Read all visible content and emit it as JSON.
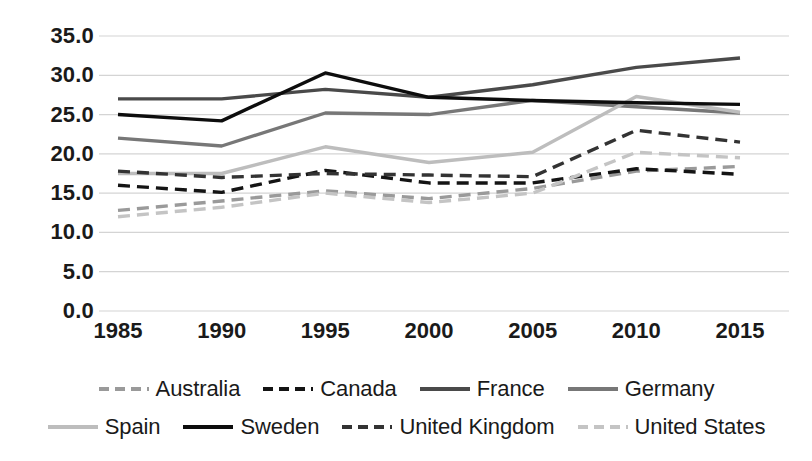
{
  "chart_data": {
    "type": "line",
    "title": "",
    "xlabel": "",
    "ylabel": "",
    "x": [
      1985,
      1990,
      1995,
      2000,
      2005,
      2010,
      2015
    ],
    "categories": [
      "1985",
      "1990",
      "1995",
      "2000",
      "2005",
      "2010",
      "2015"
    ],
    "ylim": [
      0.0,
      35.0
    ],
    "ytick_labels": [
      "35.0",
      "30.0",
      "25.0",
      "20.0",
      "15.0",
      "10.0",
      "5.0",
      "0.0"
    ],
    "ytick_values": [
      35.0,
      30.0,
      25.0,
      20.0,
      15.0,
      10.0,
      5.0,
      0.0
    ],
    "grid": true,
    "legend_position": "bottom",
    "series": [
      {
        "name": "Australia",
        "values": [
          12.8,
          14.0,
          15.3,
          14.3,
          15.6,
          17.8,
          18.4
        ],
        "color": "#9a9a9a",
        "style": "dashed",
        "width": 3.4
      },
      {
        "name": "Canada",
        "values": [
          16.0,
          15.1,
          17.9,
          16.3,
          16.3,
          18.1,
          17.4
        ],
        "color": "#141414",
        "style": "dashed",
        "width": 3.4
      },
      {
        "name": "France",
        "values": [
          27.0,
          27.0,
          28.2,
          27.2,
          28.8,
          31.0,
          32.2
        ],
        "color": "#4a4a4a",
        "style": "solid",
        "width": 3.4
      },
      {
        "name": "Germany",
        "values": [
          22.0,
          21.0,
          25.2,
          25.0,
          26.8,
          26.0,
          25.2
        ],
        "color": "#777777",
        "style": "solid",
        "width": 3.4
      },
      {
        "name": "Spain",
        "values": [
          17.5,
          17.5,
          20.9,
          18.9,
          20.2,
          27.3,
          25.3
        ],
        "color": "#bdbdbd",
        "style": "solid",
        "width": 3.4
      },
      {
        "name": "Sweden",
        "values": [
          25.0,
          24.2,
          30.3,
          27.2,
          26.8,
          26.5,
          26.3
        ],
        "color": "#0d0d0d",
        "style": "solid",
        "width": 3.4
      },
      {
        "name": "United Kingdom",
        "values": [
          17.8,
          17.0,
          17.5,
          17.3,
          17.1,
          23.0,
          21.5
        ],
        "color": "#333333",
        "style": "dashed",
        "width": 3.4
      },
      {
        "name": "United States",
        "values": [
          12.0,
          13.2,
          15.0,
          13.8,
          15.0,
          20.2,
          19.5
        ],
        "color": "#c4c4c4",
        "style": "dashed",
        "width": 3.4
      }
    ]
  },
  "axis": {
    "grid_color": "#d4d4d4"
  }
}
